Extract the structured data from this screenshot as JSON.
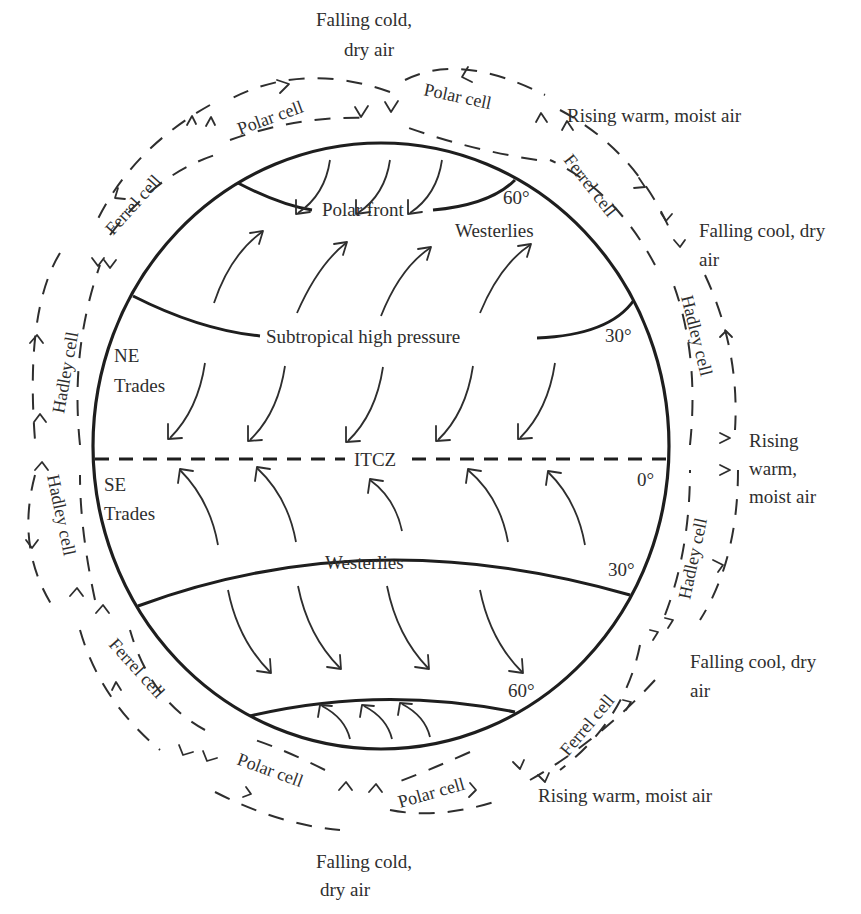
{
  "figure": {
    "air_labels": {
      "top_falling": [
        "Falling cold,",
        "dry air"
      ],
      "top_right_rising": "Rising warm, moist air",
      "upper_right_falling": [
        "Falling cool, dry",
        "air"
      ],
      "right_rising": [
        "Rising",
        "warm,",
        "moist air"
      ],
      "lower_right_falling": [
        "Falling cool, dry",
        "air"
      ],
      "bottom_right_rising": "Rising warm, moist air",
      "bottom_falling": [
        "Falling cold,",
        "dry air"
      ]
    },
    "cells": {
      "polar_nw": "Polar cell",
      "polar_ne": "Polar cell",
      "ferrel_nw": "Ferrel cell",
      "ferrel_ne": "Ferrel cell",
      "hadley_nw": "Hadley cell",
      "hadley_ne": "Hadley cell",
      "hadley_sw": "Hadley cell",
      "hadley_se": "Hadley cell",
      "ferrel_sw": "Ferrel cell",
      "ferrel_se": "Ferrel cell",
      "polar_sw": "Polar cell",
      "polar_se": "Polar cell"
    },
    "zones": {
      "polar_front": "Polar front",
      "westerlies_north": "Westerlies",
      "subtropical_high": "Subtropical high pressure",
      "ne_trades": [
        "NE",
        "Trades"
      ],
      "itcz": "ITCZ",
      "se_trades": [
        "SE",
        "Trades"
      ],
      "westerlies_south": "Westerlies"
    },
    "latitudes": {
      "n60": "60°",
      "n30": "30°",
      "eq": "0°",
      "s30": "30°",
      "s60": "60°"
    },
    "colors": {
      "line": "#1e1e1e",
      "text": "#2e2e2e",
      "background": "#ffffff"
    }
  }
}
